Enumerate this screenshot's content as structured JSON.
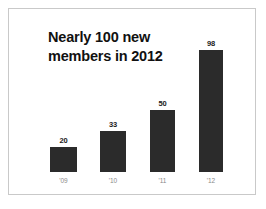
{
  "canvas": {
    "background_color": "#ffffff",
    "border_color": "#c9c9c9"
  },
  "chart_data": {
    "type": "bar",
    "title": "Nearly 100 new\nmembers in 2012",
    "xlabel": "",
    "ylabel": "",
    "categories": [
      "'09",
      "'10",
      "'11",
      "'12"
    ],
    "values": [
      20,
      33,
      50,
      98
    ],
    "value_labels": [
      "20",
      "33",
      "50",
      "98"
    ],
    "ylim": [
      0,
      98
    ],
    "grid": false,
    "legend": false,
    "bar_color": "#2b2b2b",
    "value_label_color": "#1a1a1a",
    "tick_label_color": "#8a8a8a",
    "title_color": "#111111"
  },
  "geometry": {
    "baseline_y": 172,
    "px_per_unit": 1.245,
    "bars": [
      {
        "x": 50,
        "width": 27
      },
      {
        "x": 100,
        "width": 26
      },
      {
        "x": 150,
        "width": 25
      },
      {
        "x": 199,
        "width": 24
      }
    ]
  }
}
